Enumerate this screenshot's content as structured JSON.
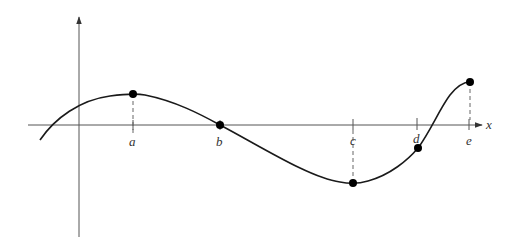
{
  "figure": {
    "type": "function-graph",
    "axis_label_x": "x",
    "colors": {
      "axis": "#555555",
      "curve": "#1a1a1a",
      "point": "#000000",
      "dash": "#666666",
      "label": "#333333"
    },
    "points": [
      {
        "id": "a",
        "label": "a",
        "feature": "local maximum"
      },
      {
        "id": "b",
        "label": "b",
        "feature": "x-intercept"
      },
      {
        "id": "c",
        "label": "c",
        "feature": "local minimum"
      },
      {
        "id": "d",
        "label": "d",
        "feature": "point on curve below axis"
      },
      {
        "id": "e",
        "label": "e",
        "feature": "right endpoint"
      }
    ]
  }
}
